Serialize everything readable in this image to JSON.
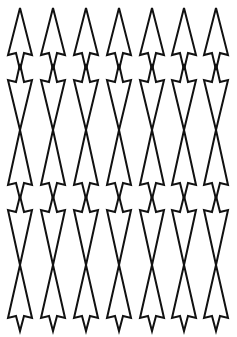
{
  "pattern": {
    "name": "arrow-tessellation",
    "stroke_color": "#111111",
    "background_color": "#ffffff",
    "columns_x": [
      20,
      53,
      86,
      119,
      152,
      184,
      216
    ],
    "half_width": 12,
    "shapes": [
      {
        "dir": "up",
        "tip": 8,
        "base": 55,
        "stem": 70
      },
      {
        "dir": "down",
        "tip": 130,
        "base": 80,
        "stem": 64
      },
      {
        "dir": "up",
        "tip": 130,
        "base": 185,
        "stem": 199
      },
      {
        "dir": "down",
        "tip": 265,
        "base": 210,
        "stem": 196
      },
      {
        "dir": "up",
        "tip": 265,
        "base": 318,
        "stem": 331
      }
    ]
  }
}
